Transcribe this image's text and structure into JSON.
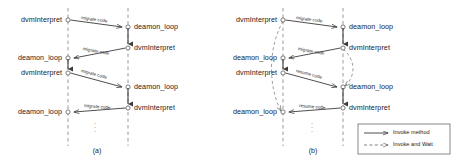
{
  "figure": {
    "title_a": "(a)",
    "title_b": "(b)",
    "colors": {
      "lifeline": "#8a8a8a",
      "arrow": "#3b3b3b",
      "text": "#1b1b1b",
      "background": "#ffffff"
    }
  },
  "panel_a": {
    "caption": "(a)",
    "left_nodes": [
      {
        "label": "dvmInterpret",
        "y": 20
      },
      {
        "label": "deamon_loop",
        "y": 58
      },
      {
        "label": "dvmInterpret",
        "y": 73
      },
      {
        "label": "deamon_loop",
        "y": 112
      }
    ],
    "right_nodes": [
      {
        "label": "deamon_loop",
        "y": 27
      },
      {
        "label": "dvmInterpret",
        "y": 48
      },
      {
        "label": "deamon_loop",
        "y": 87
      },
      {
        "label": "dvmInterpret",
        "y": 108
      }
    ],
    "edges": [
      {
        "label": "migrate code",
        "from": "left",
        "y_start": 20,
        "y_end": 27
      },
      {
        "label": "migrate code",
        "from": "right",
        "y_start": 48,
        "y_end": 58
      },
      {
        "label": "migrate code",
        "from": "left",
        "y_start": 73,
        "y_end": 87
      },
      {
        "label": "migrate code",
        "from": "right",
        "y_start": 108,
        "y_end": 112
      }
    ],
    "ellipsis": "⋮"
  },
  "panel_b": {
    "caption": "(b)",
    "left_nodes": [
      {
        "label": "dvmInterpret",
        "y": 20
      },
      {
        "label": "deamon_loop",
        "y": 58
      },
      {
        "label": "dvmInterpret",
        "y": 73
      },
      {
        "label": "deamon_loop",
        "y": 112
      }
    ],
    "right_nodes": [
      {
        "label": "deamon_loop",
        "y": 27
      },
      {
        "label": "dvmInterpret",
        "y": 48
      },
      {
        "label": "deamon_loop",
        "y": 87
      },
      {
        "label": "dvmInterpret",
        "y": 108
      }
    ],
    "edges": [
      {
        "label": "migrate code",
        "from": "left",
        "y_start": 20,
        "y_end": 27
      },
      {
        "label": "migrate code",
        "from": "right",
        "y_start": 48,
        "y_end": 58
      },
      {
        "label": "resume code",
        "from": "left",
        "y_start": 73,
        "y_end": 87
      },
      {
        "label": "resume code",
        "from": "right",
        "y_start": 108,
        "y_end": 112
      }
    ],
    "ellipsis": "⋮"
  },
  "legend": {
    "items": [
      {
        "label": "Invoke method",
        "style": "solid"
      },
      {
        "label": "Invoke and Wait",
        "style": "dashed"
      }
    ]
  }
}
